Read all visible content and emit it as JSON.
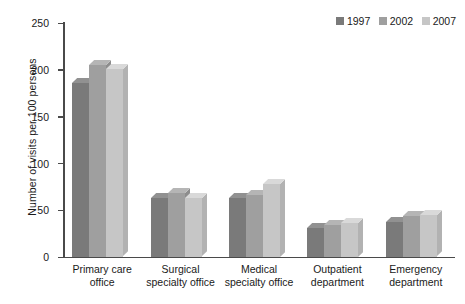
{
  "chart_data": {
    "type": "bar",
    "title": "",
    "xlabel": "",
    "ylabel": "Number of visits per 100 persons",
    "ylim": [
      0,
      250
    ],
    "yticks": [
      0,
      50,
      100,
      150,
      200,
      250
    ],
    "grid": false,
    "legend_position": "top-right",
    "categories": [
      "Primary care office",
      "Surgical specialty office",
      "Medical specialty office",
      "Outpatient department",
      "Emergency department"
    ],
    "category_lines": [
      [
        "Primary care",
        "office"
      ],
      [
        "Surgical",
        "specialty office"
      ],
      [
        "Medical",
        "specialty office"
      ],
      [
        "Outpatient",
        "department"
      ],
      [
        "Emergency",
        "department"
      ]
    ],
    "series": [
      {
        "name": "1997",
        "color": "#7a7a7a",
        "values": [
          185,
          63,
          62,
          30,
          37
        ]
      },
      {
        "name": "2002",
        "color": "#9f9f9f",
        "values": [
          205,
          68,
          66,
          34,
          43
        ]
      },
      {
        "name": "2007",
        "color": "#c6c6c6",
        "values": [
          200,
          62,
          78,
          36,
          44
        ]
      }
    ]
  },
  "legend": {
    "items": [
      {
        "label": "1997",
        "color": "#7a7a7a"
      },
      {
        "label": "2002",
        "color": "#9f9f9f"
      },
      {
        "label": "2007",
        "color": "#c6c6c6"
      }
    ]
  },
  "axes": {
    "y_title": "Number of visits per 100 persons",
    "y_tick_labels": [
      "250",
      "200",
      "150",
      "100",
      "50",
      "0"
    ]
  },
  "colors": {
    "axis": "#4a4a4a",
    "text": "#1a1a1a",
    "background": "#ffffff",
    "series_1997": "#7a7a7a",
    "series_2002": "#9f9f9f",
    "series_2007": "#c6c6c6",
    "top_1997": "#919191",
    "top_2002": "#b5b5b5",
    "top_2007": "#d9d9d9",
    "side_1997": "#6a6a6a",
    "side_2002": "#8d8d8d",
    "side_2007": "#b2b2b2"
  }
}
